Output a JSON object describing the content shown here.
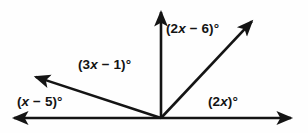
{
  "figure": {
    "type": "angle-diagram",
    "width": 308,
    "height": 133,
    "background_color": "#fefefe",
    "stroke_color": "#141414"
  },
  "geometry": {
    "vertex": {
      "x": 161,
      "y": 118
    },
    "rays": [
      {
        "name": "ray-left-horizontal",
        "tip_x": 8,
        "tip_y": 118
      },
      {
        "name": "ray-upper-left",
        "tip_x": 30,
        "tip_y": 75
      },
      {
        "name": "ray-vertical-up",
        "tip_x": 161,
        "tip_y": 6
      },
      {
        "name": "ray-upper-right",
        "tip_x": 256,
        "tip_y": 17
      },
      {
        "name": "ray-right-horizontal",
        "tip_x": 297,
        "tip_y": 118
      }
    ]
  },
  "labels": {
    "lower_left": {
      "full": "(x − 5)°",
      "open_paren": "(",
      "variable": "x",
      "rest": " − 5)°"
    },
    "upper_left": {
      "full": "(3x − 1)°",
      "coefficient": "(3",
      "variable": "x",
      "rest": " − 1)°"
    },
    "upper_right": {
      "full": "(2x − 6)°",
      "coefficient": "(2",
      "variable": "x",
      "rest": " − 6)°"
    },
    "lower_right": {
      "full": "(2x)°",
      "coefficient": "(2",
      "variable": "x",
      "rest": ")°"
    }
  }
}
